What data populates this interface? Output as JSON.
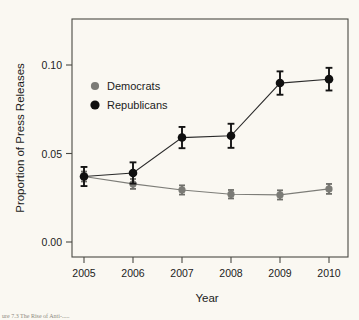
{
  "figure": {
    "background_color": "#faf8f2",
    "caption_partial": "ure 7.3   The Rise of Anti-.....",
    "frame": {
      "left": 72,
      "right": 348,
      "top": 19,
      "bottom": 257
    }
  },
  "chart_data": {
    "type": "line",
    "title": "",
    "xlabel": "Year",
    "ylabel": "Proportion of Press Releases",
    "categories": [
      "2005",
      "2006",
      "2007",
      "2008",
      "2009",
      "2010"
    ],
    "x": [
      2005,
      2006,
      2007,
      2008,
      2009,
      2010
    ],
    "xlim": [
      2004.6,
      2010.4
    ],
    "ylim": [
      0.0,
      0.118
    ],
    "yticks": [
      0.0,
      0.05,
      0.1
    ],
    "ytick_labels": [
      "0.00",
      "0.05",
      "0.10"
    ],
    "xtick_labels": [
      "2005",
      "2006",
      "2007",
      "2008",
      "2009",
      "2010"
    ],
    "grid": false,
    "legend_position": "top-left-inside",
    "error_bars": "vertical whiskers (95% confidence intervals)",
    "series": [
      {
        "name": "Democrats",
        "color": "#7b7b76",
        "marker": "circle",
        "values": [
          0.037,
          0.0328,
          0.0294,
          0.027,
          0.0266,
          0.03
        ],
        "err_low": [
          0.0342,
          0.03,
          0.0268,
          0.0246,
          0.024,
          0.0272
        ],
        "err_high": [
          0.0398,
          0.0356,
          0.032,
          0.0294,
          0.0292,
          0.0328
        ]
      },
      {
        "name": "Republicans",
        "color": "#101010",
        "marker": "circle",
        "values": [
          0.037,
          0.039,
          0.059,
          0.06,
          0.0898,
          0.092
        ],
        "err_low": [
          0.0316,
          0.033,
          0.053,
          0.0532,
          0.0832,
          0.0856
        ],
        "err_high": [
          0.0424,
          0.045,
          0.065,
          0.0668,
          0.0964,
          0.0984
        ]
      }
    ],
    "legend": [
      {
        "label": "Democrats",
        "color": "#7b7b76"
      },
      {
        "label": "Republicans",
        "color": "#101010"
      }
    ]
  }
}
